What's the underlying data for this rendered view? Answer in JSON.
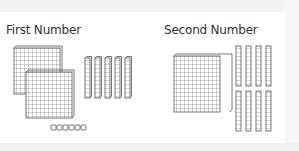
{
  "panels": [
    {
      "title": "First Number",
      "blocks": {
        "hundreds": 2,
        "tens": 5,
        "ones": 5
      },
      "value": 255
    },
    {
      "title": "Second Number",
      "blocks": {
        "hundreds": 1,
        "tens": 8,
        "ones": 0
      },
      "value": 180
    }
  ],
  "colors": {
    "block_stroke": "#555555",
    "block_fill": "#ffffff",
    "background": "#ffffff"
  }
}
